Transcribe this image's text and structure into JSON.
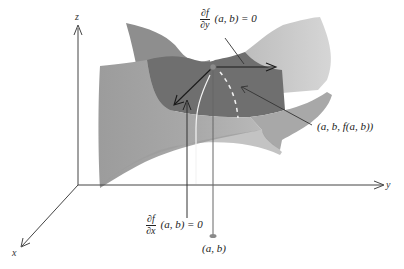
{
  "diagram": {
    "type": "saddle-surface-critical-point",
    "axes": {
      "z_label": "z",
      "y_label": "y",
      "x_label": "x"
    },
    "annotations": {
      "partial_y": {
        "numerator": "∂f",
        "denominator": "∂y",
        "rest": "(a, b) = 0"
      },
      "partial_x": {
        "numerator": "∂f",
        "denominator": "∂x",
        "rest": "(a, b) = 0"
      },
      "point_3d": "(a, b, f(a, b))",
      "point_2d": "(a, b)"
    },
    "colors": {
      "surface_dark": "#6e6e6e",
      "surface_mid": "#8f8f8f",
      "surface_light": "#b5b5b5",
      "surface_lightest": "#d2d2d2",
      "axis": "#444444",
      "arrow": "#1a1a1a",
      "point": "#8a8a8a",
      "dashed_curve": "#f2f2f2"
    }
  }
}
